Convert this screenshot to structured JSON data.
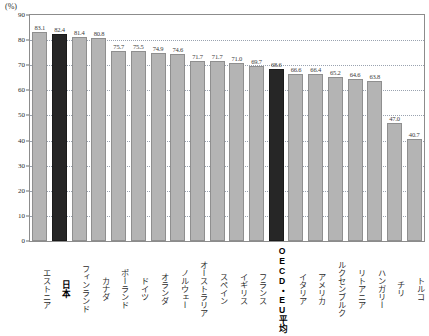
{
  "chart_data": {
    "type": "bar",
    "title": "",
    "subtitle": "",
    "unit_label": "(%)",
    "xlabel": "",
    "ylabel": "",
    "ylim": [
      0,
      90
    ],
    "ytick_step": 10,
    "yticks": [
      "90",
      "80",
      "70",
      "60",
      "50",
      "40",
      "30",
      "20",
      "10",
      "0"
    ],
    "grid": true,
    "grid_style": "dotted-horizontal",
    "legend": "none",
    "bar_color": "#b4b4b4",
    "highlight_color": "#262626",
    "categories": [
      "エストニア",
      "日本",
      "フィンランド",
      "カナダ",
      "ポーランド",
      "ドイツ",
      "オランダ",
      "ノルウェー",
      "オーストラリア",
      "スペイン",
      "イギリス",
      "フランス",
      "OECD・EU平均",
      "イタリア",
      "アメリカ",
      "ルクセンブルク",
      "リトアニア",
      "ハンガリー",
      "チリ",
      "トルコ"
    ],
    "values": [
      83.1,
      82.4,
      81.4,
      80.8,
      75.7,
      75.5,
      74.9,
      74.6,
      71.7,
      71.7,
      71.0,
      69.7,
      68.6,
      66.6,
      66.4,
      65.2,
      64.6,
      63.8,
      47.0,
      40.7
    ],
    "value_labels": [
      "83.1",
      "82.4",
      "81.4",
      "80.8",
      "75.7",
      "75.5",
      "74.9",
      "74.6",
      "71.7",
      "71.7",
      "71.0",
      "69.7",
      "68.6",
      "66.6",
      "66.4",
      "65.2",
      "64.6",
      "63.8",
      "47.0",
      "40.7"
    ],
    "highlighted": [
      false,
      true,
      false,
      false,
      false,
      false,
      false,
      false,
      false,
      false,
      false,
      false,
      true,
      false,
      false,
      false,
      false,
      false,
      false,
      false
    ],
    "bold_labels": [
      false,
      true,
      false,
      false,
      false,
      false,
      false,
      false,
      false,
      false,
      false,
      false,
      true,
      false,
      false,
      false,
      false,
      false,
      false,
      false
    ]
  }
}
